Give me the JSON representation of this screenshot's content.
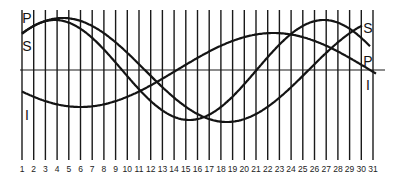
{
  "chart_data": {
    "type": "line",
    "title": "",
    "xlabel": "",
    "ylabel": "",
    "categories": [
      1,
      2,
      3,
      4,
      5,
      6,
      7,
      8,
      9,
      10,
      11,
      12,
      13,
      14,
      15,
      16,
      17,
      18,
      19,
      20,
      21,
      22,
      23,
      24,
      25,
      26,
      27,
      28,
      29,
      30,
      31
    ],
    "grid": "vertical lines at each day",
    "ylim": [
      -1,
      1
    ],
    "series": [
      {
        "name": "P",
        "label": "P",
        "description": "Physical cycle (23 days)",
        "period": 23,
        "peak_day": 3.8,
        "start_label_y": "top",
        "end_label": "P"
      },
      {
        "name": "S",
        "label": "S",
        "description": "Sensitivity/Emotional cycle (28 days)",
        "period": 28,
        "peak_day": 4.3,
        "end_label": "S"
      },
      {
        "name": "I",
        "label": "I",
        "description": "Intellectual cycle (33 days)",
        "period": 33,
        "trough_day": 6,
        "end_label": "I"
      }
    ]
  },
  "labels": {
    "left": {
      "P": "P",
      "S": "S",
      "I": "I"
    },
    "right": {
      "S": "S",
      "P": "P",
      "I": "I"
    }
  },
  "colors": {
    "ink": "#141414",
    "background": "#ffffff"
  }
}
